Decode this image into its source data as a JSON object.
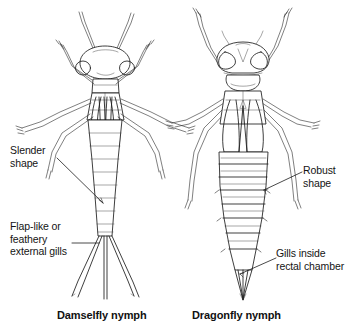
{
  "figure": {
    "ink_color": "#1c1c1c",
    "background_color": "#ffffff"
  },
  "specimens": [
    {
      "id": "damselfly",
      "caption": "Damselfly nymph",
      "traits": [
        "slender body",
        "three flap-like caudal gills"
      ]
    },
    {
      "id": "dragonfly",
      "caption": "Dragonfly nymph",
      "traits": [
        "robust body",
        "internal rectal gills"
      ]
    }
  ],
  "labels": {
    "slender_shape": "Slender\nshape",
    "external_gills": "Flap-like or\nfeathery\nexternal gills",
    "robust_shape": "Robust\nshape",
    "rectal_gills": "Gills inside\nrectal chamber"
  }
}
